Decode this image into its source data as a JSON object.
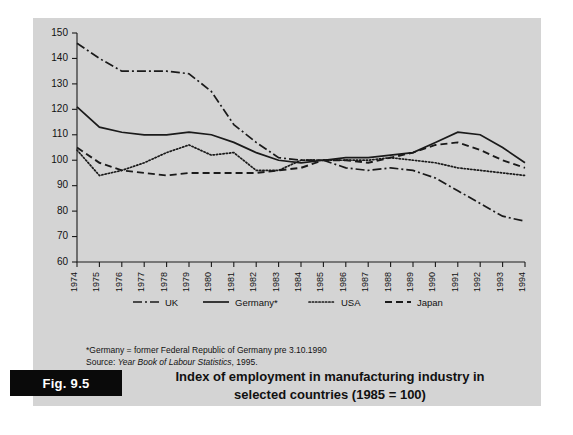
{
  "figure": {
    "tab_label": "Fig. 9.5",
    "title_line1": "Index of employment in manufacturing industry in",
    "title_line2": "selected countries (1985 = 100)",
    "footnote_line1": "*Germany = former Federal Republic of Germany pre 3.10.1990",
    "footnote_source_prefix": "Source: ",
    "footnote_source_italic": "Year Book of Labour Statistics",
    "footnote_source_suffix": ", 1995."
  },
  "chart_data": {
    "type": "line",
    "title": "Index of employment in manufacturing industry in selected countries (1985 = 100)",
    "xlabel": "",
    "ylabel": "",
    "ylim": [
      60,
      150
    ],
    "ytick_step": 10,
    "yticks": [
      60,
      70,
      80,
      90,
      100,
      110,
      120,
      130,
      140,
      150
    ],
    "grid": false,
    "legend_position": "below-axis",
    "x": [
      1974,
      1975,
      1976,
      1977,
      1978,
      1979,
      1980,
      1981,
      1982,
      1983,
      1984,
      1985,
      1986,
      1987,
      1988,
      1989,
      1990,
      1991,
      1992,
      1993,
      1994
    ],
    "categories": [
      "1974",
      "1975",
      "1976",
      "1977",
      "1978",
      "1979",
      "1980",
      "1981",
      "1982",
      "1983",
      "1984",
      "1985",
      "1986",
      "1987",
      "1988",
      "1989",
      "1990",
      "1991",
      "1992",
      "1993",
      "1994"
    ],
    "series": [
      {
        "name": "UK",
        "style": "dash-dot",
        "values": [
          146,
          140,
          135,
          135,
          135,
          134,
          127,
          114,
          107,
          101,
          100,
          100,
          97,
          96,
          97,
          96,
          93,
          88,
          83,
          78,
          76
        ]
      },
      {
        "name": "Germany*",
        "style": "solid",
        "values": [
          121,
          113,
          111,
          110,
          110,
          111,
          110,
          107,
          103,
          100,
          99,
          100,
          101,
          101,
          102,
          103,
          107,
          111,
          110,
          105,
          99
        ]
      },
      {
        "name": "USA",
        "style": "dotted",
        "values": [
          104,
          94,
          96,
          99,
          103,
          106,
          102,
          103,
          96,
          96,
          100,
          100,
          100,
          100,
          101,
          100,
          99,
          97,
          96,
          95,
          94
        ]
      },
      {
        "name": "Japan",
        "style": "dashed",
        "values": [
          105,
          99,
          96,
          95,
          94,
          95,
          95,
          95,
          95,
          96,
          97,
          100,
          100,
          99,
          101,
          103,
          106,
          107,
          104,
          100,
          97
        ]
      }
    ]
  },
  "legend": {
    "items": [
      {
        "label": "UK",
        "style": "dash-dot"
      },
      {
        "label": "Germany*",
        "style": "solid"
      },
      {
        "label": "USA",
        "style": "dotted"
      },
      {
        "label": "Japan",
        "style": "dashed"
      }
    ]
  },
  "colors": {
    "panel_background": "#d4d4d4",
    "page_background": "#ffffff",
    "ink": "#1a1a1a",
    "tab_background": "#0a0a0a",
    "tab_text": "#ffffff"
  }
}
